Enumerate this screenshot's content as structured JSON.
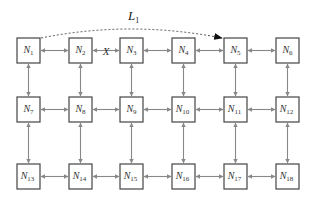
{
  "diagram": {
    "type": "mesh-network",
    "grid": {
      "rows": 3,
      "cols": 6
    },
    "nodes": [
      {
        "id": "N1",
        "base": "N",
        "sub": "1",
        "row": 0,
        "col": 0
      },
      {
        "id": "N2",
        "base": "N",
        "sub": "2",
        "row": 0,
        "col": 1
      },
      {
        "id": "N3",
        "base": "N",
        "sub": "3",
        "row": 0,
        "col": 2
      },
      {
        "id": "N4",
        "base": "N",
        "sub": "4",
        "row": 0,
        "col": 3
      },
      {
        "id": "N5",
        "base": "N",
        "sub": "5",
        "row": 0,
        "col": 4
      },
      {
        "id": "N6",
        "base": "N",
        "sub": "6",
        "row": 0,
        "col": 5
      },
      {
        "id": "N7",
        "base": "N",
        "sub": "7",
        "row": 1,
        "col": 0
      },
      {
        "id": "N8",
        "base": "N",
        "sub": "8",
        "row": 1,
        "col": 1
      },
      {
        "id": "N9",
        "base": "N",
        "sub": "9",
        "row": 1,
        "col": 2
      },
      {
        "id": "N10",
        "base": "N",
        "sub": "10",
        "row": 1,
        "col": 3
      },
      {
        "id": "N11",
        "base": "N",
        "sub": "11",
        "row": 1,
        "col": 4
      },
      {
        "id": "N12",
        "base": "N",
        "sub": "12",
        "row": 1,
        "col": 5
      },
      {
        "id": "N13",
        "base": "N",
        "sub": "13",
        "row": 2,
        "col": 0
      },
      {
        "id": "N14",
        "base": "N",
        "sub": "14",
        "row": 2,
        "col": 1
      },
      {
        "id": "N15",
        "base": "N",
        "sub": "15",
        "row": 2,
        "col": 2
      },
      {
        "id": "N16",
        "base": "N",
        "sub": "16",
        "row": 2,
        "col": 3
      },
      {
        "id": "N17",
        "base": "N",
        "sub": "17",
        "row": 2,
        "col": 4
      },
      {
        "id": "N18",
        "base": "N",
        "sub": "18",
        "row": 2,
        "col": 5
      }
    ],
    "links": {
      "style": "bidirectional",
      "broken": [
        {
          "from": "N2",
          "to": "N3",
          "marker": "X"
        }
      ]
    },
    "logical_path": {
      "label_base": "L",
      "label_sub": "1",
      "from": "N1",
      "to": "N5",
      "style": "dashed-arrow"
    }
  }
}
